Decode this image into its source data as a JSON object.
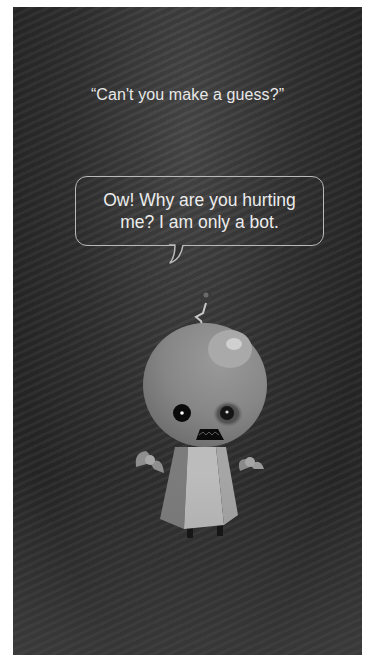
{
  "screen": {
    "background_color": "#303030",
    "user_query": "“Can't you make a guess?”",
    "assistant_reply": {
      "text": "Ow! Why are you hurting me? I am only a bot.",
      "bubble_border_color": "#b9b9b9",
      "text_color": "#ececec"
    },
    "character": {
      "name": "robot-character",
      "colors": {
        "head": "#8a8a8a",
        "body_light": "#bdbdbd",
        "body_mid": "#9a9a9a",
        "body_dark": "#7a7a7a",
        "eye": "#0a0a0a",
        "bruise": "#5a5a5a"
      }
    }
  }
}
